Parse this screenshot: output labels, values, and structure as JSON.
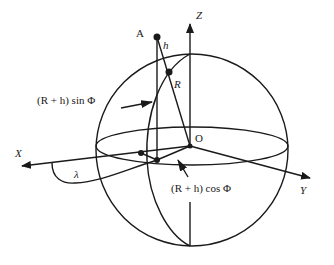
{
  "diagram": {
    "type": "geodetic-coordinate-sphere",
    "colors": {
      "stroke": "#1a1a1a",
      "background": "#ffffff"
    },
    "labels": {
      "point_A": "A",
      "height": "h",
      "radius": "R",
      "origin": "O",
      "axis_x": "X",
      "axis_y": "Y",
      "axis_z": "Z",
      "longitude": "λ",
      "z_component": "(R + h) sin Φ",
      "xy_component": "(R + h) cos Φ"
    }
  }
}
